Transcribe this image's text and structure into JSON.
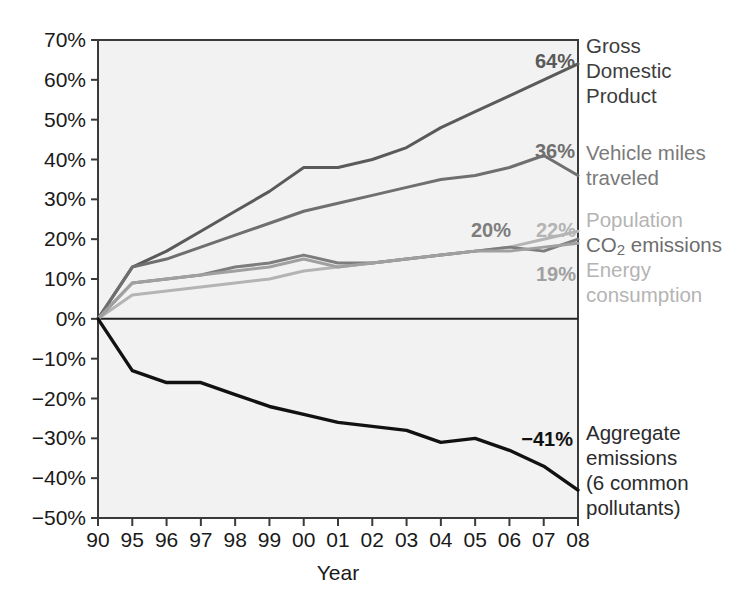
{
  "chart_data": {
    "type": "line",
    "title": "",
    "xlabel": "Year",
    "ylabel": "",
    "grid": false,
    "legend_position": "right-inline",
    "ylim": [
      -50,
      70
    ],
    "ytick_labels": [
      "70%",
      "60%",
      "50%",
      "40%",
      "30%",
      "20%",
      "10%",
      "0%",
      "−10%",
      "−20%",
      "−30%",
      "−40%",
      "−50%"
    ],
    "ytick_values": [
      70,
      60,
      50,
      40,
      30,
      20,
      10,
      0,
      -10,
      -20,
      -30,
      -40,
      -50
    ],
    "categories": [
      "90",
      "95",
      "96",
      "97",
      "98",
      "99",
      "00",
      "01",
      "02",
      "03",
      "04",
      "05",
      "06",
      "07",
      "08"
    ],
    "x": [
      1990,
      1995,
      1996,
      1997,
      1998,
      1999,
      2000,
      2001,
      2002,
      2003,
      2004,
      2005,
      2006,
      2007,
      2008
    ],
    "series": [
      {
        "name": "Gross Domestic Product",
        "label_lines": [
          "Gross",
          "Domestic",
          "Product"
        ],
        "end_value_label": "64%",
        "end_value": 64,
        "color": "#5a5a5a",
        "width": 3.0,
        "values": [
          0,
          13,
          17,
          22,
          27,
          32,
          38,
          38,
          40,
          43,
          48,
          52,
          56,
          60,
          64
        ]
      },
      {
        "name": "Vehicle miles traveled",
        "label_lines": [
          "Vehicle miles",
          "traveled"
        ],
        "end_value_label": "36%",
        "end_value": 36,
        "color": "#6f6f6f",
        "width": 3.0,
        "values": [
          0,
          13,
          15,
          18,
          21,
          24,
          27,
          29,
          31,
          33,
          35,
          36,
          38,
          41,
          36
        ]
      },
      {
        "name": "Population",
        "label_lines": [
          "Population"
        ],
        "end_value_label": "22%",
        "end_value": 22,
        "color": "#b4b4b4",
        "width": 3.0,
        "values": [
          0,
          6,
          7,
          8,
          9,
          10,
          12,
          13,
          14,
          15,
          16,
          17,
          18,
          20,
          22
        ]
      },
      {
        "name": "CO2 emissions",
        "label_lines": [
          "CO₂ emissions"
        ],
        "end_value_label": "20%",
        "end_value": 20,
        "color": "#7d7d7d",
        "width": 3.0,
        "values": [
          0,
          9,
          10,
          11,
          13,
          14,
          16,
          14,
          14,
          15,
          16,
          17,
          18,
          17,
          20
        ]
      },
      {
        "name": "Energy consumption",
        "label_lines": [
          "Energy",
          "consumption"
        ],
        "end_value_label": "19%",
        "end_value": 19,
        "color": "#a0a0a0",
        "width": 3.0,
        "values": [
          0,
          9,
          10,
          11,
          12,
          13,
          15,
          13,
          14,
          15,
          16,
          17,
          17,
          18,
          19
        ]
      },
      {
        "name": "Aggregate emissions (6 common pollutants)",
        "label_lines": [
          "Aggregate",
          "emissions",
          "(6 common",
          "pollutants)"
        ],
        "end_value_label": "−41%",
        "end_value": -41,
        "color": "#111111",
        "width": 3.4,
        "values": [
          0,
          -13,
          -16,
          -16,
          -19,
          -22,
          -24,
          -26,
          -27,
          -28,
          -31,
          -30,
          -33,
          -37,
          -43
        ]
      }
    ]
  },
  "axes": {
    "x_title": "Year"
  },
  "colors": {
    "plot_background": "#f2f2f2",
    "page_background": "#ffffff",
    "axis": "#3a3a3a",
    "text": "#1a1a1a"
  }
}
